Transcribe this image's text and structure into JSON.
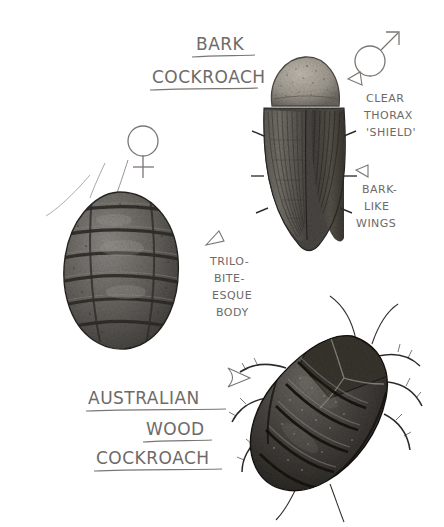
{
  "page": {
    "medium": "pencil-drawing",
    "background_color": "#ffffff",
    "ink_color": "#6e6a68"
  },
  "titles": [
    {
      "name": "bark-cockroach-title",
      "lines": [
        "BARK",
        "COCKROACH"
      ],
      "underlined": true,
      "x": 196,
      "y": 50
    },
    {
      "name": "australian-wood-cockroach-title",
      "lines": [
        "AUSTRALIAN",
        "WOOD",
        "COCKROACH"
      ],
      "underlined": true,
      "x": 167,
      "y": 400
    }
  ],
  "annotations": [
    {
      "name": "clear-thorax-shield",
      "lines": [
        "CLEAR",
        "THORAX",
        "'SHIELD'"
      ],
      "arrow": "up-left",
      "x": 365,
      "y": 104
    },
    {
      "name": "bark-like-wings",
      "lines": [
        "BARK-",
        "LIKE",
        "WINGS"
      ],
      "arrow": "up-left",
      "x": 360,
      "y": 195
    },
    {
      "name": "trilobite-esque-body",
      "lines": [
        "TRILO-",
        "BITE-",
        "ESQUE",
        "BODY"
      ],
      "arrow": "left",
      "x": 212,
      "y": 262
    }
  ],
  "symbols": [
    {
      "name": "female-symbol",
      "glyph": "venus",
      "label": "female",
      "cx": 143,
      "cy": 147
    },
    {
      "name": "male-symbol",
      "glyph": "mars",
      "label": "male",
      "cx": 374,
      "cy": 56
    }
  ],
  "specimens": [
    {
      "name": "bark-cockroach-female",
      "species": "Bark Cockroach",
      "sex": "female",
      "description": "oval segmented trilobite-like wingless body with banded dorsal plates",
      "body_color": "#5d5b59"
    },
    {
      "name": "bark-cockroach-male",
      "species": "Bark Cockroach",
      "sex": "male",
      "description": "pale speckled pronotum shield with long dark striated bark-like wings",
      "body_color": "#4a4846",
      "shield_color": "#a9a49c"
    },
    {
      "name": "australian-wood-cockroach",
      "species": "Australian Wood Cockroach",
      "sex": "",
      "description": "dark heavily segmented body tilted diagonally with spiny legs and antennae",
      "body_color": "#3c3a38"
    }
  ]
}
